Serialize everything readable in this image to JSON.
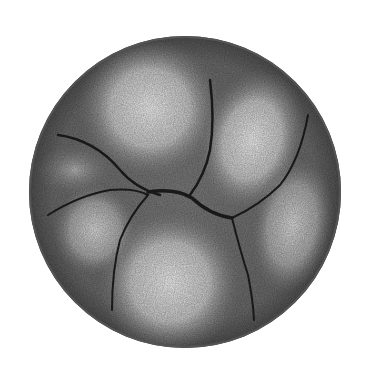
{
  "image": {
    "subject": "spherical lobed chambered specimen illustration",
    "background": "#ffffff",
    "shell": {
      "cx": 185,
      "cy": 192,
      "r": 156,
      "edge_color": "#5a5a5a",
      "fill_color": "#777777"
    },
    "suture_color": "#1e1e1e",
    "chambers": [
      {
        "name": "top",
        "cx": 150,
        "cy": 110,
        "rx": 62,
        "ry": 62,
        "highlight": "#efefef"
      },
      {
        "name": "upper-right",
        "cx": 250,
        "cy": 140,
        "rx": 42,
        "ry": 62,
        "highlight": "#e6e6e6"
      },
      {
        "name": "right",
        "cx": 292,
        "cy": 225,
        "rx": 30,
        "ry": 55,
        "highlight": "#d6d6d6"
      },
      {
        "name": "bottom",
        "cx": 170,
        "cy": 282,
        "rx": 62,
        "ry": 62,
        "highlight": "#ededed"
      },
      {
        "name": "left-upper",
        "cx": 75,
        "cy": 170,
        "rx": 30,
        "ry": 20,
        "highlight": "#b8b8b8"
      },
      {
        "name": "left-lower",
        "cx": 95,
        "cy": 228,
        "rx": 35,
        "ry": 38,
        "highlight": "#c4c4c4"
      }
    ]
  }
}
